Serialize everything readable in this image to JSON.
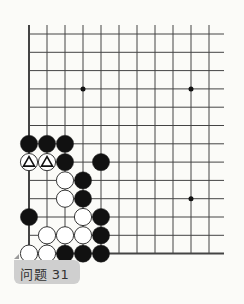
{
  "problem": {
    "label": "问题 31"
  },
  "board": {
    "background": "#fbfbf8",
    "line_color": "#444444",
    "cols": 11,
    "rows": 13,
    "x0": 29,
    "y0": 34,
    "dx": 18,
    "dy": 18.3,
    "star_points": [
      [
        3,
        3
      ],
      [
        9,
        3
      ],
      [
        9,
        9
      ]
    ],
    "stones": [
      {
        "c": 0,
        "r": 6,
        "color": "black"
      },
      {
        "c": 1,
        "r": 6,
        "color": "black"
      },
      {
        "c": 2,
        "r": 6,
        "color": "black"
      },
      {
        "c": 0,
        "r": 7,
        "color": "white",
        "mark": "triangle"
      },
      {
        "c": 1,
        "r": 7,
        "color": "white",
        "mark": "triangle"
      },
      {
        "c": 2,
        "r": 7,
        "color": "black"
      },
      {
        "c": 4,
        "r": 7,
        "color": "black"
      },
      {
        "c": 2,
        "r": 8,
        "color": "white"
      },
      {
        "c": 3,
        "r": 8,
        "color": "black"
      },
      {
        "c": 2,
        "r": 9,
        "color": "white"
      },
      {
        "c": 3,
        "r": 9,
        "color": "black"
      },
      {
        "c": 0,
        "r": 10,
        "color": "black"
      },
      {
        "c": 3,
        "r": 10,
        "color": "white"
      },
      {
        "c": 4,
        "r": 10,
        "color": "black"
      },
      {
        "c": 1,
        "r": 11,
        "color": "white"
      },
      {
        "c": 2,
        "r": 11,
        "color": "white"
      },
      {
        "c": 3,
        "r": 11,
        "color": "white"
      },
      {
        "c": 4,
        "r": 11,
        "color": "black"
      },
      {
        "c": 0,
        "r": 12,
        "color": "white"
      },
      {
        "c": 1,
        "r": 12,
        "color": "white"
      },
      {
        "c": 2,
        "r": 12,
        "color": "black"
      },
      {
        "c": 3,
        "r": 12,
        "color": "black"
      },
      {
        "c": 4,
        "r": 12,
        "color": "black"
      }
    ]
  }
}
